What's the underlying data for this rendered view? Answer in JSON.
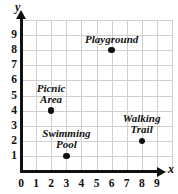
{
  "chart_data": {
    "type": "scatter",
    "title": "",
    "xlabel": "x",
    "ylabel": "y",
    "xlim": [
      0,
      10
    ],
    "ylim": [
      0,
      10
    ],
    "grid": true,
    "legend": "none",
    "x_ticks": [
      "0",
      "1",
      "2",
      "3",
      "4",
      "5",
      "6",
      "7",
      "8",
      "9"
    ],
    "y_ticks": [
      "1",
      "2",
      "3",
      "4",
      "5",
      "6",
      "7",
      "8",
      "9"
    ],
    "points": [
      {
        "label": "Playground",
        "lines": [
          "Playground"
        ],
        "x": 6,
        "y": 8,
        "label_position": "above",
        "label_align": "center"
      },
      {
        "label": "Picnic Area",
        "lines": [
          "Picnic",
          "Area"
        ],
        "x": 2,
        "y": 4,
        "label_position": "above",
        "label_align": "center"
      },
      {
        "label": "Swimming Pool",
        "lines": [
          "Swimming",
          "Pool"
        ],
        "x": 3,
        "y": 1,
        "label_position": "above",
        "label_align": "center"
      },
      {
        "label": "Walking Trail",
        "lines": [
          "Walking",
          "Trail"
        ],
        "x": 8,
        "y": 2,
        "label_position": "above",
        "label_align": "center"
      }
    ],
    "colors": {
      "point": "#111111",
      "axis": "#111111",
      "grid": "#cfcfcf",
      "background": "#ffffff"
    }
  }
}
